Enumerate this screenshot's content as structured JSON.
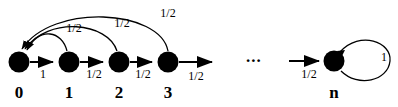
{
  "figure": {
    "kind": "markov-chain-state-diagram",
    "stroke_color": "#000000",
    "node_fill": "#000000",
    "background": "#ffffff",
    "ellipsis": "...",
    "nodes": [
      {
        "id": "0",
        "label": "0",
        "cx": 19,
        "cy": 62,
        "r": 10.5
      },
      {
        "id": "1",
        "label": "1",
        "cx": 69,
        "cy": 62,
        "r": 10.5
      },
      {
        "id": "2",
        "label": "2",
        "cx": 119,
        "cy": 62,
        "r": 10.5
      },
      {
        "id": "3",
        "label": "3",
        "cx": 168,
        "cy": 62,
        "r": 10.5
      },
      {
        "id": "n",
        "label": "n",
        "cx": 334,
        "cy": 61,
        "r": 10.5
      }
    ],
    "forward_edges": [
      {
        "from": "0",
        "to": "1",
        "label": "1",
        "label_x": 43,
        "label_y": 72
      },
      {
        "from": "1",
        "to": "2",
        "label": "1/2",
        "label_x": 94,
        "label_y": 72
      },
      {
        "from": "2",
        "to": "3",
        "label": "1/2",
        "label_x": 143,
        "label_y": 72
      },
      {
        "from": "3",
        "to": "...",
        "label": "1/2",
        "label_x": 196,
        "label_y": 74
      },
      {
        "from": "...",
        "to": "n",
        "label": "1/2",
        "label_x": 309,
        "label_y": 72
      }
    ],
    "back_edges": [
      {
        "from": "1",
        "to": "0",
        "label": "1/2",
        "label_x": 74,
        "label_y": 28
      },
      {
        "from": "2",
        "to": "0",
        "label": "1/2",
        "label_x": 122,
        "label_y": 23
      },
      {
        "from": "3",
        "to": "0",
        "label": "1/2",
        "label_x": 168,
        "label_y": 14
      }
    ],
    "self_loop": {
      "at": "n",
      "label": "1",
      "label_x": 383,
      "label_y": 56
    }
  }
}
